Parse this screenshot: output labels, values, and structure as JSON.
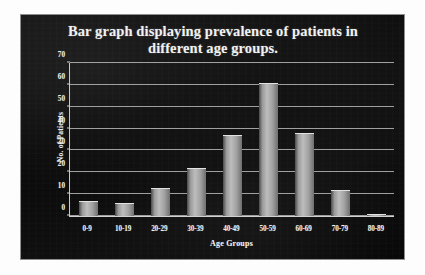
{
  "chart_data": {
    "type": "bar",
    "title": "Bar graph displaying prevalence of patients in different age groups.",
    "title_line1": "Bar graph displaying prevalence of patients in",
    "title_line2": "different age groups.",
    "xlabel": "Age Groups",
    "ylabel": "No. of Patients",
    "categories": [
      "0-9",
      "10-19",
      "20-29",
      "30-39",
      "40-49",
      "50-59",
      "60-69",
      "70-79",
      "80-89"
    ],
    "values": [
      7,
      6,
      13,
      22,
      37,
      61,
      38,
      12,
      1
    ],
    "ylim": [
      0,
      70
    ],
    "ytick_labels": [
      "70",
      "60",
      "50",
      "40",
      "30",
      "20",
      "10",
      "0"
    ],
    "ytick_values": [
      70,
      60,
      50,
      40,
      30,
      20,
      10,
      0
    ],
    "ytick_step": 10,
    "grid": true,
    "legend": "none",
    "colors": {
      "panel_background": "#0c0c0c",
      "panel_border": "#8e8e8e",
      "text": "#f2f2f2",
      "gridline": "#b9b9b9",
      "bar_light": "#bdbdbd",
      "bar_dark": "#4a4a4a",
      "page_background": "#ffffff"
    }
  }
}
